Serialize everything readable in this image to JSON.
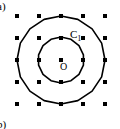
{
  "figure": {
    "part_label_top": "a)",
    "part_label_bottom": "b)",
    "curve_label_inner": "C",
    "curve_label_inner_sub": "1",
    "center_label": "O",
    "stroke_color": "#000000",
    "background_color": "#ffffff",
    "lattice": {
      "name": "square-lattice",
      "columns": 5,
      "rows": 5,
      "spacing_px": 22,
      "origin_x_px": 17,
      "origin_y_px": 16,
      "point_size_px": 4,
      "point_shape": "square",
      "point_color": "#000000"
    },
    "circles": [
      {
        "name": "outer-circle",
        "center_x_px": 61,
        "center_y_px": 60,
        "radius_px": 44,
        "sides": 16,
        "stroke_width_px": 1.6,
        "label": ""
      },
      {
        "name": "inner-circle",
        "center_x_px": 61,
        "center_y_px": 60,
        "radius_px": 23,
        "sides": 14,
        "stroke_width_px": 1.6,
        "label": "C1"
      }
    ],
    "center_point": {
      "x_px": 61,
      "y_px": 60,
      "size_px": 4
    }
  }
}
